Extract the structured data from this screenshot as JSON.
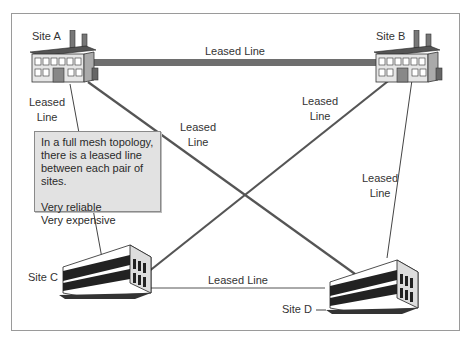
{
  "diagram": {
    "title": "Full mesh topology",
    "sites": [
      {
        "id": "A",
        "label": "Site A",
        "type": "factory"
      },
      {
        "id": "B",
        "label": "Site B",
        "type": "factory"
      },
      {
        "id": "C",
        "label": "Site C",
        "type": "office"
      },
      {
        "id": "D",
        "label": "Site D",
        "type": "office"
      }
    ],
    "links": [
      {
        "from": "A",
        "to": "B",
        "label": "Leased Line",
        "style": "thick"
      },
      {
        "from": "A",
        "to": "C",
        "label_line1": "Leased",
        "label_line2": "Line"
      },
      {
        "from": "A",
        "to": "D",
        "label_line1": "Leased",
        "label_line2": "Line"
      },
      {
        "from": "B",
        "to": "C",
        "label_line1": "Leased",
        "label_line2": "Line"
      },
      {
        "from": "B",
        "to": "D",
        "label_line1": "Leased",
        "label_line2": "Line"
      },
      {
        "from": "C",
        "to": "D",
        "label": "Leased Line"
      }
    ],
    "info_box": {
      "line1": "In a full mesh topology,",
      "line2": "there is a leased line",
      "line3": "between each pair of sites.",
      "line4": "Very reliable",
      "line5": "Very expensive"
    },
    "colors": {
      "frame_border": "#9a9a9a",
      "thick_link": "#6e6e6e",
      "link": "#555555",
      "info_bg": "#e2e2e2"
    }
  }
}
